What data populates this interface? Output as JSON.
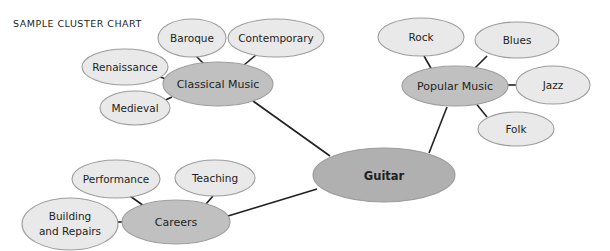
{
  "chart_data": {
    "type": "diagram",
    "diagram_type": "cluster-chart",
    "title": "SAMPLE CLUSTER CHART",
    "center": {
      "id": "guitar",
      "label": "Guitar",
      "role": "center",
      "fill": "#b0b0b0",
      "cx": 384,
      "cy": 175,
      "rx": 71,
      "ry": 27
    },
    "branches": [
      {
        "id": "classical-music",
        "label": "Classical Music",
        "role": "branch",
        "fill": "#c0c0c0",
        "cx": 218,
        "cy": 84,
        "rx": 55,
        "ry": 22,
        "leaves": [
          {
            "id": "renaissance",
            "label": "Renaissance",
            "cx": 125,
            "cy": 67,
            "rx": 43,
            "ry": 18
          },
          {
            "id": "baroque",
            "label": "Baroque",
            "cx": 192,
            "cy": 38,
            "rx": 34,
            "ry": 19
          },
          {
            "id": "contemporary",
            "label": "Contemporary",
            "cx": 276,
            "cy": 38,
            "rx": 48,
            "ry": 19
          },
          {
            "id": "medieval",
            "label": "Medieval",
            "cx": 135,
            "cy": 108,
            "rx": 35,
            "ry": 17
          }
        ]
      },
      {
        "id": "popular-music",
        "label": "Popular Music",
        "role": "branch",
        "fill": "#c0c0c0",
        "cx": 455,
        "cy": 86,
        "rx": 53,
        "ry": 20,
        "leaves": [
          {
            "id": "rock",
            "label": "Rock",
            "cx": 421,
            "cy": 37,
            "rx": 43,
            "ry": 19
          },
          {
            "id": "blues",
            "label": "Blues",
            "cx": 517,
            "cy": 40,
            "rx": 42,
            "ry": 18
          },
          {
            "id": "jazz",
            "label": "Jazz",
            "cx": 553,
            "cy": 85,
            "rx": 37,
            "ry": 19
          },
          {
            "id": "folk",
            "label": "Folk",
            "cx": 516,
            "cy": 129,
            "rx": 38,
            "ry": 17
          }
        ]
      },
      {
        "id": "careers",
        "label": "Careers",
        "role": "branch",
        "fill": "#c0c0c0",
        "cx": 176,
        "cy": 222,
        "rx": 54,
        "ry": 22,
        "leaves": [
          {
            "id": "performance",
            "label": "Performance",
            "cx": 116,
            "cy": 179,
            "rx": 44,
            "ry": 19
          },
          {
            "id": "teaching",
            "label": "Teaching",
            "cx": 215,
            "cy": 178,
            "rx": 40,
            "ry": 18
          },
          {
            "id": "building-and-repairs",
            "label": "Building and Repairs",
            "label_line1": "Building",
            "label_line2": "and Repairs",
            "cx": 70,
            "cy": 224,
            "rx": 48,
            "ry": 26
          }
        ]
      }
    ],
    "edges": [
      {
        "from": "guitar",
        "to": "classical-music",
        "x1": 330,
        "y1": 156,
        "x2": 253,
        "y2": 101
      },
      {
        "from": "guitar",
        "to": "popular-music",
        "x1": 429,
        "y1": 153,
        "x2": 447,
        "y2": 107
      },
      {
        "from": "guitar",
        "to": "careers",
        "x1": 317,
        "y1": 189,
        "x2": 228,
        "y2": 216
      },
      {
        "from": "classical-music",
        "to": "renaissance",
        "x1": 166,
        "y1": 79,
        "x2": 148,
        "y2": 73
      },
      {
        "from": "classical-music",
        "to": "baroque",
        "x1": 204,
        "y1": 64,
        "x2": 196,
        "y2": 56
      },
      {
        "from": "classical-music",
        "to": "contemporary",
        "x1": 244,
        "y1": 65,
        "x2": 256,
        "y2": 55
      },
      {
        "from": "classical-music",
        "to": "medieval",
        "x1": 172,
        "y1": 97,
        "x2": 159,
        "y2": 103
      },
      {
        "from": "popular-music",
        "to": "rock",
        "x1": 432,
        "y1": 70,
        "x2": 424,
        "y2": 56
      },
      {
        "from": "popular-music",
        "to": "blues",
        "x1": 473,
        "y1": 70,
        "x2": 487,
        "y2": 56
      },
      {
        "from": "popular-music",
        "to": "jazz",
        "x1": 508,
        "y1": 85,
        "x2": 517,
        "y2": 85
      },
      {
        "from": "popular-music",
        "to": "folk",
        "x1": 474,
        "y1": 101,
        "x2": 487,
        "y2": 117
      },
      {
        "from": "careers",
        "to": "performance",
        "x1": 144,
        "y1": 206,
        "x2": 130,
        "y2": 196
      },
      {
        "from": "careers",
        "to": "teaching",
        "x1": 206,
        "y1": 204,
        "x2": 213,
        "y2": 196
      },
      {
        "from": "careers",
        "to": "building-and-repairs",
        "x1": 122,
        "y1": 222,
        "x2": 112,
        "y2": 222
      }
    ],
    "colors": {
      "background": "#ffffff",
      "center_fill": "#b0b0b0",
      "branch_fill": "#c0c0c0",
      "leaf_fill": "#e9e9e9",
      "node_stroke": "#9d9d9d",
      "edge_stroke": "#231f20",
      "text": "#231f20"
    }
  }
}
